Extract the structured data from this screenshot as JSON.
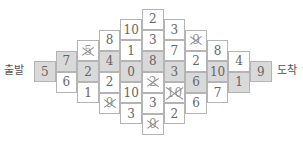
{
  "labels": {
    "start": "출발",
    "end": "도착"
  },
  "colors": {
    "shaded": "#d9d9d9",
    "border": "#b4b4b4",
    "text": "#666666"
  },
  "grid": {
    "columns": [
      {
        "cells": [
          {
            "value": "5",
            "shaded": true,
            "crossed": false
          }
        ]
      },
      {
        "cells": [
          {
            "value": "7",
            "shaded": true,
            "crossed": false
          },
          {
            "value": "6",
            "shaded": false,
            "crossed": false
          }
        ]
      },
      {
        "cells": [
          {
            "value": "5",
            "shaded": false,
            "crossed": true
          },
          {
            "value": "2",
            "shaded": true,
            "crossed": false
          },
          {
            "value": "1",
            "shaded": false,
            "crossed": false
          }
        ]
      },
      {
        "cells": [
          {
            "value": "8",
            "shaded": false,
            "crossed": false
          },
          {
            "value": "4",
            "shaded": true,
            "crossed": false
          },
          {
            "value": "2",
            "shaded": false,
            "crossed": false
          },
          {
            "value": "9",
            "shaded": false,
            "crossed": true
          }
        ]
      },
      {
        "cells": [
          {
            "value": "10",
            "shaded": false,
            "crossed": false
          },
          {
            "value": "1",
            "shaded": false,
            "crossed": false
          },
          {
            "value": "0",
            "shaded": true,
            "crossed": false
          },
          {
            "value": "10",
            "shaded": false,
            "crossed": false
          },
          {
            "value": "3",
            "shaded": false,
            "crossed": false
          }
        ]
      },
      {
        "cells": [
          {
            "value": "2",
            "shaded": false,
            "crossed": false
          },
          {
            "value": "3",
            "shaded": false,
            "crossed": false
          },
          {
            "value": "8",
            "shaded": true,
            "crossed": false
          },
          {
            "value": "2",
            "shaded": false,
            "crossed": true
          },
          {
            "value": "3",
            "shaded": false,
            "crossed": false
          },
          {
            "value": "0",
            "shaded": false,
            "crossed": true
          }
        ]
      },
      {
        "cells": [
          {
            "value": "3",
            "shaded": false,
            "crossed": false
          },
          {
            "value": "7",
            "shaded": false,
            "crossed": false
          },
          {
            "value": "3",
            "shaded": true,
            "crossed": false
          },
          {
            "value": "10",
            "shaded": false,
            "crossed": true
          },
          {
            "value": "2",
            "shaded": false,
            "crossed": false
          }
        ]
      },
      {
        "cells": [
          {
            "value": "9",
            "shaded": false,
            "crossed": true
          },
          {
            "value": "2",
            "shaded": false,
            "crossed": false
          },
          {
            "value": "6",
            "shaded": true,
            "crossed": false
          },
          {
            "value": "6",
            "shaded": false,
            "crossed": false
          }
        ]
      },
      {
        "cells": [
          {
            "value": "8",
            "shaded": false,
            "crossed": false
          },
          {
            "value": "10",
            "shaded": true,
            "crossed": false
          },
          {
            "value": "7",
            "shaded": false,
            "crossed": false
          }
        ]
      },
      {
        "cells": [
          {
            "value": "4",
            "shaded": false,
            "crossed": false
          },
          {
            "value": "1",
            "shaded": true,
            "crossed": false
          }
        ]
      },
      {
        "cells": [
          {
            "value": "9",
            "shaded": true,
            "crossed": false
          }
        ]
      }
    ]
  }
}
